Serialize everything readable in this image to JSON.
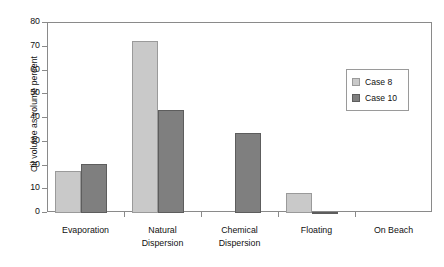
{
  "chart_data": {
    "type": "bar",
    "title": "",
    "xlabel": "",
    "ylabel": "Oil volume as volume percent",
    "ylim": [
      0,
      80
    ],
    "ytick_step": 10,
    "yticks": [
      0,
      10,
      20,
      30,
      40,
      50,
      60,
      70,
      80
    ],
    "ytick_labels": [
      "0",
      "10",
      "20",
      "30",
      "40",
      "50",
      "60",
      "70",
      "80"
    ],
    "grid": false,
    "legend_position": "center-right",
    "categories": [
      "Evaporation",
      "Natural Dispersion",
      "Chemical Dispersion",
      "Floating",
      "On Beach"
    ],
    "category_lines": [
      [
        "Evaporation",
        ""
      ],
      [
        "Natural",
        "Dispersion"
      ],
      [
        "Chemical",
        "Dispersion"
      ],
      [
        "Floating",
        ""
      ],
      [
        "On Beach",
        ""
      ]
    ],
    "series": [
      {
        "name": "Case 8",
        "color": "#c9c9c9",
        "values": [
          17.5,
          72.5,
          0,
          8.5,
          0
        ]
      },
      {
        "name": "Case 10",
        "color": "#7f7f7f",
        "values": [
          20.5,
          43.5,
          33.5,
          0.5,
          0
        ]
      }
    ]
  },
  "legend": {
    "entries": [
      {
        "label": "Case 8"
      },
      {
        "label": "Case 10"
      }
    ]
  }
}
